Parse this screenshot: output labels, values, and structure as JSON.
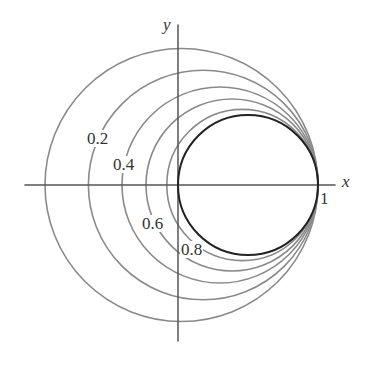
{
  "diagram": {
    "type": "level-curves",
    "axes": {
      "x_label": "x",
      "y_label": "y",
      "tick_label_1": "1"
    },
    "colors": {
      "axis": "#555555",
      "level_curve": "#8a8a8a",
      "unit_circle": "#222222",
      "text": "#333333"
    },
    "curves": [
      {
        "level": "0",
        "label": "",
        "center_x": 0.025,
        "radius": 0.975
      },
      {
        "level": "0.2",
        "label": "0.2",
        "center_x": 0.18,
        "radius": 0.82
      },
      {
        "level": "0.4",
        "label": "0.4",
        "center_x": 0.3,
        "radius": 0.7
      },
      {
        "level": "0.6",
        "label": "0.6",
        "center_x": 0.386,
        "radius": 0.614
      },
      {
        "level": "0.8",
        "label": "0.8",
        "center_x": 0.46,
        "radius": 0.54
      },
      {
        "level": "1",
        "label": "",
        "center_x": 0.5,
        "radius": 0.5
      }
    ],
    "labels": {
      "l02": "0.2",
      "l04": "0.4",
      "l06": "0.6",
      "l08": "0.8"
    }
  }
}
